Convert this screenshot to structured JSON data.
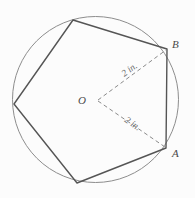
{
  "figure": {
    "type": "circle-inscribed-regular-pentagon",
    "background_color": "#fcfcfc",
    "circle": {
      "name": "circumscribed-circle",
      "center_x": 95.5,
      "center_y": 99.5,
      "radius": 83,
      "stroke_color": "#8d8d8d",
      "stroke_width": 1
    },
    "pentagon": {
      "name": "inscribed-pentagon",
      "stroke_color": "#555555",
      "stroke_width": 1.4,
      "fill": "none",
      "points": "167,49 73,20 14,104 77,183 166,148",
      "vertices": [
        {
          "label": "B",
          "x": 167,
          "y": 49
        },
        {
          "label": "",
          "x": 73,
          "y": 20
        },
        {
          "label": "",
          "x": 14,
          "y": 104
        },
        {
          "label": "",
          "x": 77,
          "y": 183
        },
        {
          "label": "A",
          "x": 166,
          "y": 148
        }
      ]
    },
    "radii": [
      {
        "name": "radius-to-b",
        "from_x": 98,
        "from_y": 100,
        "to_x": 166,
        "to_y": 50,
        "stroke_color": "#8a8a8a",
        "stroke_width": 1,
        "dash": "4 3",
        "measure": "2 in.",
        "measure_x": 131,
        "measure_y": 72,
        "measure_rotation": -36
      },
      {
        "name": "radius-to-a",
        "from_x": 98,
        "from_y": 101,
        "to_x": 165,
        "to_y": 147,
        "stroke_color": "#8a8a8a",
        "stroke_width": 1,
        "dash": "4 3",
        "measure": "2 in.",
        "measure_x": 131,
        "measure_y": 126,
        "measure_rotation": 35
      }
    ],
    "labels": {
      "center": {
        "text": "O",
        "x": 82,
        "y": 104
      },
      "vertex_b": {
        "text": "B",
        "x": 172,
        "y": 48
      },
      "vertex_a": {
        "text": "A",
        "x": 172,
        "y": 157
      }
    }
  }
}
